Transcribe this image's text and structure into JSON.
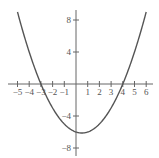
{
  "chart_data": {
    "type": "line",
    "title": "",
    "xlabel": "",
    "ylabel": "",
    "function": "f(x) = (x + 3)(x - 4) / 2",
    "xlim": [
      -5,
      6
    ],
    "ylim": [
      -8,
      9
    ],
    "grid": false,
    "legend": null,
    "x_ticks": [
      -5,
      -4,
      -3,
      -2,
      -1,
      1,
      2,
      3,
      4,
      5,
      6
    ],
    "x_tick_labels": [
      "−5",
      "−4",
      "−3",
      "−2",
      "−1",
      "1",
      "2",
      "3",
      "4",
      "5",
      "6"
    ],
    "y_ticks": [
      8,
      4,
      -4,
      -8
    ],
    "y_tick_labels": [
      "8",
      "4",
      "−4",
      "−8"
    ],
    "series": [
      {
        "name": "parabola",
        "x": [
          -5,
          -4,
          -3,
          -2,
          -1,
          0,
          0.5,
          1,
          2,
          3,
          4,
          5,
          6
        ],
        "y": [
          9,
          4,
          0,
          -3,
          -5,
          -6,
          -6.125,
          -6,
          -5,
          -3,
          0,
          4,
          9
        ]
      }
    ],
    "roots": [
      -3,
      4
    ],
    "vertex": [
      0.5,
      -6.125
    ],
    "colors": {
      "curve": "#555555",
      "axes": "#666666"
    }
  }
}
